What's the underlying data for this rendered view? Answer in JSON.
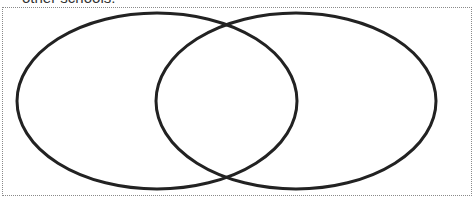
{
  "caption": {
    "text": "other schools:"
  },
  "venn": {
    "stroke": "#222222",
    "stroke_width": 3,
    "circles": [
      {
        "name": "left-set",
        "cx": 157,
        "cy": 101,
        "rx": 140,
        "ry": 88,
        "label": ""
      },
      {
        "name": "right-set",
        "cx": 296,
        "cy": 101,
        "rx": 140,
        "ry": 88,
        "label": ""
      }
    ]
  }
}
